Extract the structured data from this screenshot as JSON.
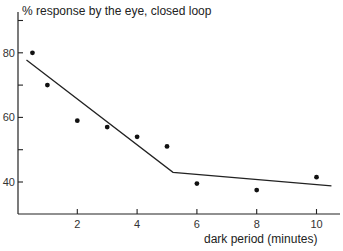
{
  "chart_data": {
    "type": "scatter",
    "title": "% response by the eye, closed loop",
    "xlabel": "dark period (minutes)",
    "ylabel": "% response by the eye, closed loop",
    "xlim": [
      0,
      10.7
    ],
    "ylim": [
      30,
      92
    ],
    "x_ticks": [
      2,
      4,
      6,
      8,
      10
    ],
    "x_tick_labels": [
      "2",
      "4",
      "6",
      "8",
      "10"
    ],
    "y_ticks": [
      40,
      50,
      60,
      70,
      80,
      90
    ],
    "y_tick_labels": [
      "40",
      "",
      "60",
      "",
      "80",
      ""
    ],
    "grid": false,
    "series": [
      {
        "name": "measurements",
        "kind": "points",
        "x": [
          0.5,
          1,
          2,
          3,
          4,
          5,
          6,
          8,
          10
        ],
        "y": [
          80,
          70,
          59,
          57,
          54,
          51,
          39.5,
          37.5,
          41.5
        ]
      },
      {
        "name": "fit",
        "kind": "line",
        "x": [
          0.3,
          5.2,
          10.5
        ],
        "y": [
          77.8,
          43,
          38.8
        ]
      }
    ]
  },
  "text": {
    "title": "% response by the eye, closed loop",
    "xlabel": "dark period (minutes)"
  }
}
